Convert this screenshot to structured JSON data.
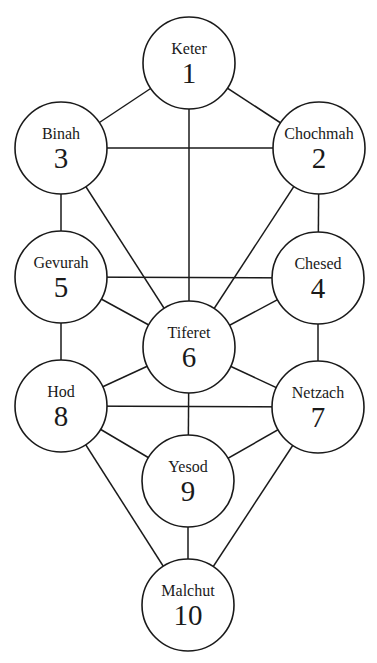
{
  "diagram": {
    "title": "",
    "colors": {
      "stroke": "#1a1a1a",
      "fill": "#ffffff",
      "background": "#ffffff"
    },
    "radius": 46,
    "nodes": [
      {
        "id": "keter",
        "name": "Keter",
        "number": "1",
        "cx": 189,
        "cy": 63
      },
      {
        "id": "chochmah",
        "name": "Chochmah",
        "number": "2",
        "cx": 319,
        "cy": 148
      },
      {
        "id": "binah",
        "name": "Binah",
        "number": "3",
        "cx": 61,
        "cy": 148
      },
      {
        "id": "chesed",
        "name": "Chesed",
        "number": "4",
        "cx": 318,
        "cy": 278
      },
      {
        "id": "gevurah",
        "name": "Gevurah",
        "number": "5",
        "cx": 61,
        "cy": 277
      },
      {
        "id": "tiferet",
        "name": "Tiferet",
        "number": "6",
        "cx": 189,
        "cy": 347
      },
      {
        "id": "netzach",
        "name": "Netzach",
        "number": "7",
        "cx": 318,
        "cy": 407
      },
      {
        "id": "hod",
        "name": "Hod",
        "number": "8",
        "cx": 61,
        "cy": 406
      },
      {
        "id": "yesod",
        "name": "Yesod",
        "number": "9",
        "cx": 188,
        "cy": 481
      },
      {
        "id": "malchut",
        "name": "Malchut",
        "number": "10",
        "cx": 188,
        "cy": 605
      }
    ],
    "edges": [
      [
        "keter",
        "binah"
      ],
      [
        "keter",
        "chochmah"
      ],
      [
        "keter",
        "tiferet"
      ],
      [
        "binah",
        "chochmah"
      ],
      [
        "binah",
        "gevurah"
      ],
      [
        "binah",
        "tiferet"
      ],
      [
        "chochmah",
        "chesed"
      ],
      [
        "chochmah",
        "tiferet"
      ],
      [
        "gevurah",
        "chesed"
      ],
      [
        "gevurah",
        "tiferet"
      ],
      [
        "gevurah",
        "hod"
      ],
      [
        "chesed",
        "tiferet"
      ],
      [
        "chesed",
        "netzach"
      ],
      [
        "tiferet",
        "hod"
      ],
      [
        "tiferet",
        "netzach"
      ],
      [
        "tiferet",
        "yesod"
      ],
      [
        "hod",
        "netzach"
      ],
      [
        "hod",
        "yesod"
      ],
      [
        "hod",
        "malchut"
      ],
      [
        "netzach",
        "yesod"
      ],
      [
        "netzach",
        "malchut"
      ],
      [
        "yesod",
        "malchut"
      ]
    ]
  }
}
